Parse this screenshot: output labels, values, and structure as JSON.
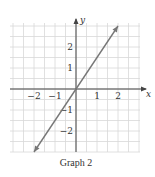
{
  "chart_data": {
    "type": "line",
    "title": "Graph 2",
    "xlabel": "x",
    "ylabel": "y",
    "xlim": [
      -3,
      3
    ],
    "ylim": [
      -3,
      3
    ],
    "grid": true,
    "grid_step": 0.5,
    "x_ticks": [
      {
        "value": -2,
        "label": "−2"
      },
      {
        "value": -1,
        "label": "−1"
      },
      {
        "value": 1,
        "label": "1"
      },
      {
        "value": 2,
        "label": "2"
      }
    ],
    "y_ticks": [
      {
        "value": 2,
        "label": "2"
      },
      {
        "value": 1,
        "label": "1"
      },
      {
        "value": -1,
        "label": "−1"
      },
      {
        "value": -2,
        "label": "−2"
      }
    ],
    "series": [
      {
        "name": "y = 1.5x",
        "x": [
          -2,
          2
        ],
        "y": [
          -3,
          3
        ],
        "arrows": "both"
      }
    ],
    "colors": {
      "line": "#777777",
      "axis": "#444444",
      "grid": "#d8d8d8"
    }
  }
}
